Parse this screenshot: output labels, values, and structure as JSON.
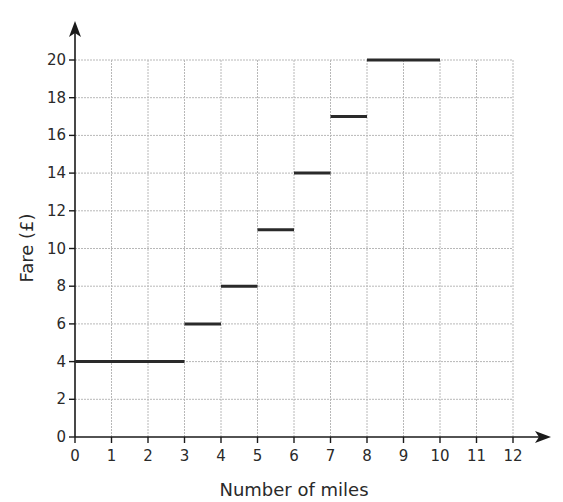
{
  "chart_data": {
    "type": "line",
    "subtype": "step",
    "title": "",
    "xlabel": "Number of miles",
    "ylabel": "Fare (£)",
    "xlim": [
      0,
      12
    ],
    "ylim": [
      0,
      20
    ],
    "x_ticks": [
      0,
      1,
      2,
      3,
      4,
      5,
      6,
      7,
      8,
      9,
      10,
      11,
      12
    ],
    "y_ticks": [
      0,
      2,
      4,
      6,
      8,
      10,
      12,
      14,
      16,
      18,
      20
    ],
    "grid": true,
    "legend": null,
    "series": [
      {
        "name": "Fare",
        "segments": [
          {
            "x_start": 0,
            "x_end": 3,
            "y": 4
          },
          {
            "x_start": 3,
            "x_end": 4,
            "y": 6
          },
          {
            "x_start": 4,
            "x_end": 5,
            "y": 8
          },
          {
            "x_start": 5,
            "x_end": 6,
            "y": 11
          },
          {
            "x_start": 6,
            "x_end": 7,
            "y": 14
          },
          {
            "x_start": 7,
            "x_end": 8,
            "y": 17
          },
          {
            "x_start": 8,
            "x_end": 10,
            "y": 20
          }
        ]
      }
    ]
  },
  "colors": {
    "axis": "#1a1a1a",
    "grid": "#b8b8b8",
    "step_line": "#2a2a2a",
    "text": "#2a2a2a"
  }
}
